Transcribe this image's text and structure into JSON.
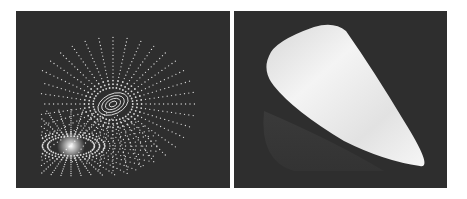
{
  "figure": {
    "panels": [
      {
        "id": "left",
        "description": "Dotted field-line rendering with two spiral vortex centers on dark background",
        "background": "#2e2e2e",
        "foreground": "#e8e8e8"
      },
      {
        "id": "right",
        "description": "Smooth shaded white surface (tapered lobe) on dark background",
        "background": "#2e2e2e",
        "foreground": "#f2f2f2"
      }
    ]
  }
}
